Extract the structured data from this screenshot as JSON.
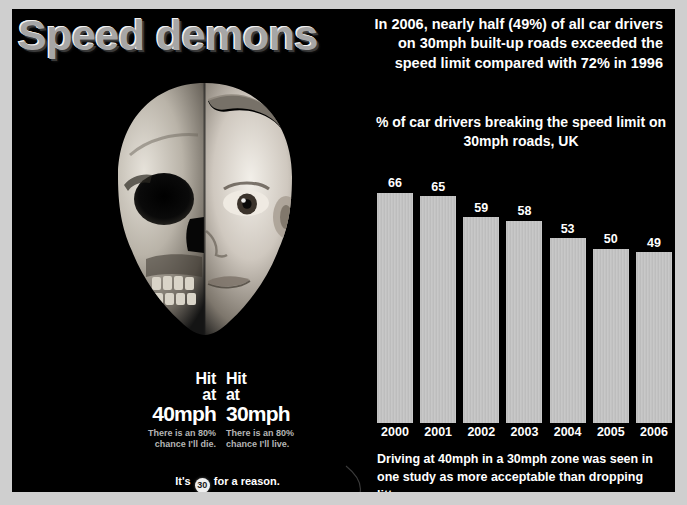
{
  "title": "Speed demons",
  "headline": "In 2006, nearly half (49%) of all car drivers on 30mph built-up roads exceeded the speed limit compared with 72% in 1996",
  "chart_title": "% of car drivers breaking the speed limit on 30mph roads, UK",
  "caption": "Driving at 40mph in a 30mph zone was seen in one study as more acceptable than dropping litter.",
  "photo_alt": "half-skull-half-child-face",
  "hit_left": {
    "line1": "Hit",
    "line2": "at",
    "line3": "40mph",
    "sub": "There is an 80% chance I'll die."
  },
  "hit_right": {
    "line1": "Hit",
    "line2": "at",
    "line3": "30mph",
    "sub": "There is an 80% chance I'll live."
  },
  "tagline": {
    "prefix": "It's",
    "roundel": "30",
    "suffix": "for a reason."
  },
  "colors": {
    "background": "#000000",
    "border": "#cfcfcf",
    "bar": "#c2c2c2",
    "text": "#ffffff",
    "muted_text": "#b5b5b5",
    "title_fill": "#a6a6a6"
  },
  "chart_data": {
    "type": "bar",
    "title": "% of car drivers breaking the speed limit on 30mph roads, UK",
    "xlabel": "",
    "ylabel": "",
    "ylim": [
      0,
      70
    ],
    "grid": false,
    "legend": "none",
    "categories": [
      "2000",
      "2001",
      "2002",
      "2003",
      "2004",
      "2005",
      "2006"
    ],
    "values": [
      66,
      65,
      59,
      58,
      53,
      50,
      49
    ],
    "annotations": [
      "In 2006, nearly half (49%) of all car drivers on 30mph built-up roads exceeded the speed limit compared with 72% in 1996",
      "Driving at 40mph in a 30mph zone was seen in one study as more acceptable than dropping litter."
    ]
  }
}
